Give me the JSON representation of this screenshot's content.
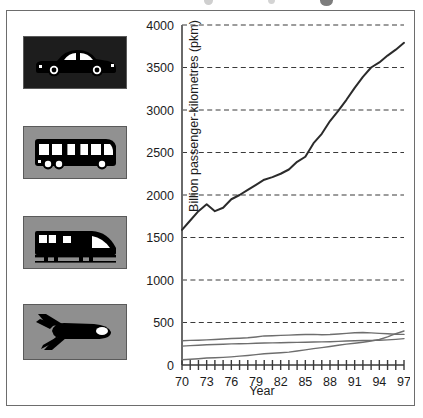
{
  "figure": {
    "background_color": "#ffffff",
    "frame_color": "#6d6d6d"
  },
  "legend_icons": [
    {
      "name": "car-icon",
      "label": "Car",
      "tile_background": "#1d1d1d",
      "glyph_color": "#000000"
    },
    {
      "name": "bus-icon",
      "label": "Bus",
      "tile_background": "#919191",
      "glyph_color": "#000000"
    },
    {
      "name": "train-icon",
      "label": "Rail",
      "tile_background": "#8f8f8f",
      "glyph_color": "#000000"
    },
    {
      "name": "plane-icon",
      "label": "Air",
      "tile_background": "#8f8f8f",
      "glyph_color": "#000000"
    }
  ],
  "chart_data": {
    "type": "line",
    "title": "",
    "xlabel": "Year",
    "ylabel": "Billion passenger-kilometres (pkm)",
    "xlim": [
      70,
      97
    ],
    "ylim": [
      0,
      4000
    ],
    "ytick_values": [
      0,
      500,
      1000,
      1500,
      2000,
      2500,
      3000,
      3500,
      4000
    ],
    "ytick_labels": [
      "0",
      "500",
      "1000",
      "1500",
      "2000",
      "2500",
      "3000",
      "3500",
      "4000"
    ],
    "xtick_values": [
      70,
      73,
      76,
      79,
      82,
      85,
      88,
      91,
      94,
      97
    ],
    "xtick_labels": [
      "70",
      "73",
      "76",
      "79",
      "82",
      "85",
      "88",
      "91",
      "94",
      "97"
    ],
    "xtick_minor_values": [
      70,
      71,
      72,
      73,
      74,
      75,
      76,
      77,
      78,
      79,
      80,
      81,
      82,
      83,
      84,
      85,
      86,
      87,
      88,
      89,
      90,
      91,
      92,
      93,
      94,
      95,
      96,
      97
    ],
    "grid": "horizontal-dashed",
    "grid_color": "#3a3a3a",
    "legend_position": "left-icon-column",
    "x": [
      70,
      71,
      72,
      73,
      74,
      75,
      76,
      77,
      78,
      79,
      80,
      81,
      82,
      83,
      84,
      85,
      86,
      87,
      88,
      89,
      90,
      91,
      92,
      93,
      94,
      95,
      96,
      97
    ],
    "series": [
      {
        "name": "Car",
        "icon": "car-icon",
        "color": "#2b2b2b",
        "line_width": 2.0,
        "values": [
          1590,
          1700,
          1810,
          1890,
          1810,
          1850,
          1950,
          2000,
          2060,
          2120,
          2180,
          2210,
          2250,
          2300,
          2390,
          2450,
          2610,
          2720,
          2870,
          2990,
          3120,
          3260,
          3390,
          3500,
          3560,
          3640,
          3710,
          3790
        ]
      },
      {
        "name": "Bus",
        "icon": "bus-icon",
        "color": "#6e6e6e",
        "line_width": 1.4,
        "values": [
          285,
          290,
          292,
          296,
          300,
          305,
          312,
          315,
          320,
          330,
          342,
          345,
          348,
          352,
          355,
          358,
          360,
          355,
          358,
          365,
          372,
          380,
          383,
          378,
          372,
          368,
          362,
          360
        ]
      },
      {
        "name": "Rail",
        "icon": "train-icon",
        "color": "#6e6e6e",
        "line_width": 1.4,
        "values": [
          222,
          228,
          232,
          238,
          242,
          245,
          248,
          250,
          252,
          255,
          258,
          260,
          262,
          264,
          266,
          268,
          270,
          272,
          274,
          278,
          282,
          285,
          288,
          290,
          292,
          296,
          302,
          310
        ]
      },
      {
        "name": "Air",
        "icon": "plane-icon",
        "color": "#6e6e6e",
        "line_width": 1.4,
        "values": [
          62,
          68,
          74,
          82,
          86,
          90,
          96,
          104,
          112,
          122,
          132,
          138,
          145,
          152,
          165,
          178,
          192,
          205,
          218,
          232,
          245,
          256,
          268,
          282,
          300,
          330,
          368,
          400
        ]
      }
    ]
  }
}
